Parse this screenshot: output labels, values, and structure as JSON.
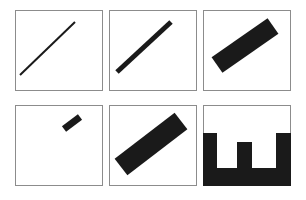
{
  "figure": {
    "canvas": {
      "width": 306,
      "height": 200,
      "background": "#ffffff"
    },
    "layout": {
      "rows": 2,
      "cols": 3,
      "panel_width": 88,
      "panel_height": 81
    },
    "colors": {
      "shape_fill": "#1a1a1a",
      "panel_background": "#ffffff",
      "panel_border": "#8c8c8c"
    }
  },
  "panels": [
    {
      "id": "panel-1",
      "name": "thin-diagonal-line",
      "row": 1,
      "col": 1,
      "frame": {
        "x": 15,
        "y": 10,
        "width": 88,
        "height": 81
      },
      "border": true,
      "shape": {
        "type": "line",
        "orientation": "diagonal-up-right",
        "angle_deg": 32,
        "thickness_px": 2,
        "x1": 5,
        "y1": 65,
        "x2": 60,
        "y2": 12
      }
    },
    {
      "id": "panel-2",
      "name": "medium-diagonal-bar",
      "row": 1,
      "col": 2,
      "frame": {
        "x": 109,
        "y": 10,
        "width": 88,
        "height": 81
      },
      "border": true,
      "shape": {
        "type": "line",
        "orientation": "diagonal-up-right",
        "angle_deg": 32,
        "thickness_px": 5,
        "x1": 8,
        "y1": 62,
        "x2": 62,
        "y2": 12
      }
    },
    {
      "id": "panel-3",
      "name": "thick-diagonal-bar",
      "row": 1,
      "col": 3,
      "frame": {
        "x": 203,
        "y": 10,
        "width": 88,
        "height": 81
      },
      "border": true,
      "shape": {
        "type": "line",
        "orientation": "diagonal-up-right",
        "angle_deg": 34,
        "thickness_px": 19,
        "x1": 14,
        "y1": 55,
        "x2": 70,
        "y2": 16
      }
    },
    {
      "id": "panel-4",
      "name": "short-thick-bar-upper-right",
      "row": 2,
      "col": 1,
      "frame": {
        "x": 15,
        "y": 105,
        "width": 88,
        "height": 81
      },
      "border": true,
      "shape": {
        "type": "line",
        "orientation": "diagonal-up-right",
        "angle_deg": 34,
        "thickness_px": 7,
        "x1": 49,
        "y1": 24,
        "x2": 65,
        "y2": 12
      }
    },
    {
      "id": "panel-5",
      "name": "thick-long-diagonal-bar",
      "row": 2,
      "col": 2,
      "frame": {
        "x": 109,
        "y": 105,
        "width": 88,
        "height": 81
      },
      "border": true,
      "shape": {
        "type": "line",
        "orientation": "diagonal-up-right",
        "angle_deg": 34,
        "thickness_px": 21,
        "x1": 12,
        "y1": 62,
        "x2": 72,
        "y2": 16
      }
    },
    {
      "id": "panel-6",
      "name": "comb-w-shape",
      "row": 2,
      "col": 3,
      "frame": {
        "x": 203,
        "y": 105,
        "width": 88,
        "height": 81
      },
      "border": true,
      "shape": {
        "type": "comb",
        "description": "solid base bar with three upward prongs; outer prongs taller than the centre prong",
        "base": {
          "x": 0,
          "y": 63,
          "width": 88,
          "height": 20
        },
        "prongs": [
          {
            "name": "left-prong",
            "x": 0,
            "y": 28,
            "width": 14,
            "height": 35
          },
          {
            "name": "centre-prong",
            "x": 34,
            "y": 37,
            "width": 15,
            "height": 26
          },
          {
            "name": "right-prong",
            "x": 73,
            "y": 28,
            "width": 15,
            "height": 35
          }
        ]
      }
    }
  ]
}
